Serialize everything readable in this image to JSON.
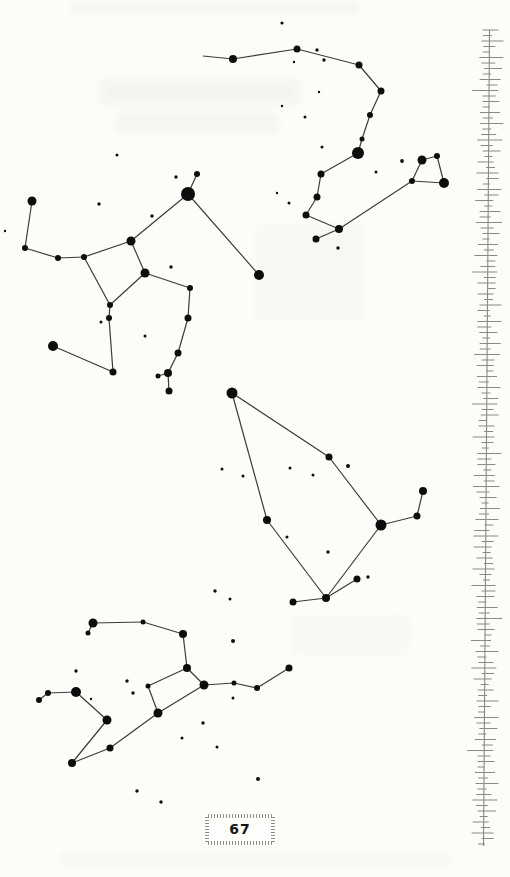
{
  "page_number": "67",
  "colors": {
    "paper": "#fcfcf9",
    "star": "#0d0d0d",
    "line": "#3b3b38",
    "border_tick": "#8a8a82",
    "hatch": "#8f8f89"
  },
  "star_chart": {
    "width": 510,
    "height": 877,
    "constellations": [
      {
        "name": "top-chain",
        "stars": [
          [
            233,
            59,
            4
          ],
          [
            297,
            49,
            3.5
          ],
          [
            359,
            65,
            3.5
          ],
          [
            381,
            91,
            3.5
          ],
          [
            370,
            115,
            3
          ],
          [
            362,
            139,
            2.5
          ],
          [
            358,
            153,
            6
          ],
          [
            321,
            174,
            3.5
          ],
          [
            317,
            197,
            3.5
          ],
          [
            306,
            215,
            3.5
          ],
          [
            339,
            229,
            4
          ],
          [
            316,
            239,
            3.5
          ],
          [
            412,
            181,
            3
          ],
          [
            422,
            160,
            4.5
          ],
          [
            437,
            156,
            3
          ],
          [
            444,
            183,
            5
          ],
          [
            203,
            56,
            0
          ]
        ],
        "edges": [
          [
            16,
            0
          ],
          [
            0,
            1
          ],
          [
            1,
            2
          ],
          [
            2,
            3
          ],
          [
            3,
            4
          ],
          [
            4,
            5
          ],
          [
            5,
            6
          ],
          [
            6,
            7
          ],
          [
            7,
            8
          ],
          [
            8,
            9
          ],
          [
            9,
            10
          ],
          [
            10,
            11
          ],
          [
            10,
            12
          ],
          [
            12,
            13
          ],
          [
            13,
            14
          ],
          [
            14,
            15
          ],
          [
            15,
            12
          ]
        ]
      },
      {
        "name": "mid-left-group",
        "stars": [
          [
            188,
            194,
            7
          ],
          [
            197,
            174,
            3
          ],
          [
            259,
            275,
            5
          ],
          [
            131,
            241,
            4.5
          ],
          [
            84,
            257,
            3
          ],
          [
            58,
            258,
            3
          ],
          [
            25,
            248,
            3
          ],
          [
            32,
            201,
            4.5
          ],
          [
            145,
            273,
            4.5
          ],
          [
            110,
            305,
            3
          ],
          [
            109,
            318,
            3
          ],
          [
            113,
            372,
            3.5
          ],
          [
            53,
            346,
            5
          ],
          [
            190,
            288,
            3
          ],
          [
            188,
            318,
            3.5
          ],
          [
            178,
            353,
            3.5
          ],
          [
            168,
            373,
            4
          ],
          [
            158,
            376,
            2.5
          ],
          [
            169,
            391,
            3.5
          ]
        ],
        "edges": [
          [
            0,
            1
          ],
          [
            0,
            2
          ],
          [
            0,
            3
          ],
          [
            3,
            4
          ],
          [
            4,
            5
          ],
          [
            5,
            6
          ],
          [
            6,
            7
          ],
          [
            3,
            8
          ],
          [
            8,
            9
          ],
          [
            9,
            4
          ],
          [
            8,
            13
          ],
          [
            13,
            14
          ],
          [
            14,
            15
          ],
          [
            15,
            16
          ],
          [
            16,
            17
          ],
          [
            16,
            18
          ],
          [
            9,
            10
          ],
          [
            10,
            11
          ],
          [
            11,
            12
          ]
        ]
      },
      {
        "name": "kite-group",
        "stars": [
          [
            232,
            393,
            5.5
          ],
          [
            329,
            457,
            3.5
          ],
          [
            381,
            525,
            5.5
          ],
          [
            417,
            516,
            3.5
          ],
          [
            423,
            491,
            4
          ],
          [
            326,
            598,
            4
          ],
          [
            293,
            602,
            3.5
          ],
          [
            357,
            579,
            3.5
          ],
          [
            267,
            520,
            4
          ]
        ],
        "edges": [
          [
            0,
            1
          ],
          [
            1,
            2
          ],
          [
            2,
            3
          ],
          [
            3,
            4
          ],
          [
            2,
            5
          ],
          [
            5,
            6
          ],
          [
            5,
            7
          ],
          [
            0,
            8
          ],
          [
            8,
            5
          ]
        ]
      },
      {
        "name": "bottom-group",
        "stars": [
          [
            93,
            623,
            4.5
          ],
          [
            88,
            633,
            2.5
          ],
          [
            143,
            622,
            2.5
          ],
          [
            183,
            634,
            4
          ],
          [
            187,
            668,
            4
          ],
          [
            204,
            685,
            4.5
          ],
          [
            148,
            686,
            2.5
          ],
          [
            158,
            713,
            4.5
          ],
          [
            234,
            683,
            2.5
          ],
          [
            257,
            688,
            3
          ],
          [
            289,
            668,
            3.5
          ],
          [
            48,
            693,
            3
          ],
          [
            39,
            700,
            3
          ],
          [
            76,
            692,
            5
          ],
          [
            107,
            720,
            4.5
          ],
          [
            72,
            763,
            4
          ],
          [
            110,
            748,
            3.5
          ]
        ],
        "edges": [
          [
            0,
            1
          ],
          [
            0,
            2
          ],
          [
            2,
            3
          ],
          [
            3,
            4
          ],
          [
            4,
            5
          ],
          [
            4,
            6
          ],
          [
            6,
            7
          ],
          [
            7,
            5
          ],
          [
            5,
            8
          ],
          [
            8,
            9
          ],
          [
            9,
            10
          ],
          [
            11,
            12
          ],
          [
            11,
            13
          ],
          [
            13,
            14
          ],
          [
            14,
            15
          ],
          [
            15,
            16
          ],
          [
            16,
            7
          ]
        ]
      }
    ],
    "field_stars": [
      [
        282,
        23,
        1.6
      ],
      [
        317,
        50,
        1.7
      ],
      [
        324,
        60,
        1.7
      ],
      [
        294,
        62,
        1.2
      ],
      [
        319,
        92,
        1.2
      ],
      [
        282,
        106,
        1.2
      ],
      [
        305,
        117,
        1.5
      ],
      [
        322,
        147,
        1.5
      ],
      [
        402,
        161,
        1.9
      ],
      [
        376,
        172,
        1.5
      ],
      [
        277,
        193,
        1.2
      ],
      [
        289,
        203,
        1.5
      ],
      [
        338,
        248,
        1.7
      ],
      [
        117,
        155,
        1.5
      ],
      [
        176,
        177,
        1.7
      ],
      [
        99,
        204,
        1.7
      ],
      [
        152,
        216,
        1.7
      ],
      [
        171,
        267,
        1.7
      ],
      [
        101,
        322,
        1.5
      ],
      [
        145,
        336,
        1.5
      ],
      [
        5,
        231,
        1.2
      ],
      [
        222,
        469,
        1.5
      ],
      [
        243,
        476,
        1.5
      ],
      [
        290,
        468,
        1.5
      ],
      [
        313,
        475,
        1.5
      ],
      [
        348,
        466,
        2
      ],
      [
        287,
        537,
        1.5
      ],
      [
        328,
        552,
        1.7
      ],
      [
        215,
        591,
        1.7
      ],
      [
        230,
        599,
        1.5
      ],
      [
        368,
        577,
        1.7
      ],
      [
        76,
        671,
        1.7
      ],
      [
        127,
        681,
        1.7
      ],
      [
        133,
        693,
        1.7
      ],
      [
        91,
        699,
        1.2
      ],
      [
        233,
        641,
        2
      ],
      [
        233,
        698,
        1.5
      ],
      [
        203,
        723,
        1.7
      ],
      [
        182,
        738,
        1.5
      ],
      [
        217,
        747,
        1.5
      ],
      [
        258,
        779,
        2
      ],
      [
        137,
        791,
        1.7
      ],
      [
        161,
        802,
        1.7
      ]
    ]
  },
  "side_border": {
    "x_top": 489.5,
    "x_bottom": 483.5,
    "top": 30,
    "bottom": 846,
    "spacing": 5.5,
    "tick_lengths": [
      16,
      9,
      22,
      12,
      7,
      24,
      14,
      18,
      8,
      21,
      11,
      26,
      13,
      17,
      7,
      20,
      10,
      23,
      9,
      15,
      25,
      12,
      18,
      8
    ],
    "tick_offsets": [
      1,
      -2,
      3,
      0,
      -3,
      2,
      -1,
      4,
      -2,
      1,
      3,
      -4,
      0,
      2,
      -3,
      1,
      -1,
      3,
      -2,
      0
    ]
  }
}
